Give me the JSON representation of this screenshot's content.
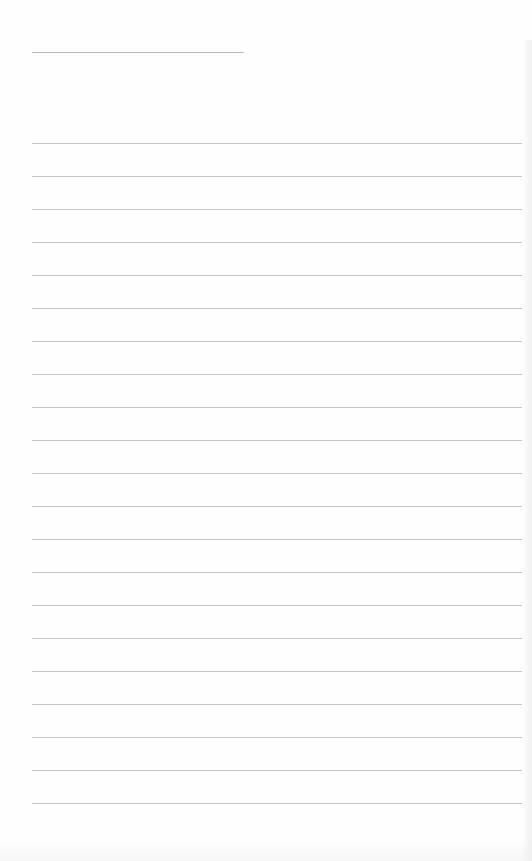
{
  "document": {
    "type": "lined-paper",
    "title_line": {
      "present": true,
      "text": ""
    },
    "ruled_lines": {
      "count": 21,
      "first_y": 143,
      "spacing": 33,
      "lines": [
        "",
        "",
        "",
        "",
        "",
        "",
        "",
        "",
        "",
        "",
        "",
        "",
        "",
        "",
        "",
        "",
        "",
        "",
        "",
        "",
        ""
      ]
    },
    "colors": {
      "paper": "#fefefe",
      "rule": "#c4c4c4",
      "title_rule": "#b9b9b9"
    }
  }
}
